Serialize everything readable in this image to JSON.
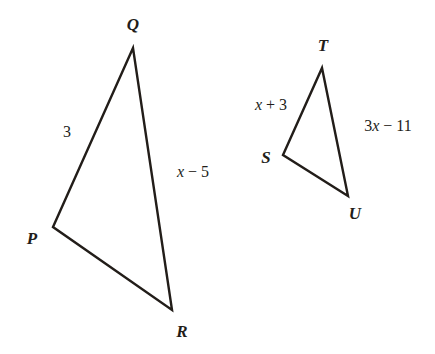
{
  "figure": {
    "background_color": "#ffffff",
    "stroke_color": "#221d19",
    "text_color": "#221d19",
    "stroke_width": 2.4,
    "width": 435,
    "height": 354
  },
  "triangles": [
    {
      "name": "PQR",
      "vertices": [
        {
          "label": "P",
          "x": 53,
          "y": 227,
          "label_x": 32,
          "label_y": 238
        },
        {
          "label": "Q",
          "x": 133,
          "y": 48,
          "label_x": 133,
          "label_y": 24
        },
        {
          "label": "R",
          "x": 172,
          "y": 310,
          "label_x": 182,
          "label_y": 331
        }
      ],
      "path": "M 53 227 L 133 48 L 172 310 Z",
      "sides": [
        {
          "name": "PQ",
          "label_full": "3",
          "prefix": "3",
          "variable": "",
          "operator": "",
          "constant": "",
          "label_x": 67,
          "label_y": 132
        },
        {
          "name": "QR",
          "label_full": "x − 5",
          "prefix": "",
          "variable": "x",
          "operator": " − ",
          "constant": "5",
          "label_x": 193,
          "label_y": 172
        }
      ]
    },
    {
      "name": "STU",
      "vertices": [
        {
          "label": "S",
          "x": 283,
          "y": 155,
          "label_x": 266,
          "label_y": 157
        },
        {
          "label": "T",
          "x": 322,
          "y": 68,
          "label_x": 323,
          "label_y": 45
        },
        {
          "label": "U",
          "x": 348,
          "y": 196,
          "label_x": 355,
          "label_y": 213
        }
      ],
      "path": "M 283 155 L 322 68 L 348 196 Z",
      "sides": [
        {
          "name": "ST",
          "label_full": "x + 3",
          "prefix": "",
          "variable": "x",
          "operator": " + ",
          "constant": "3",
          "label_x": 271,
          "label_y": 105
        },
        {
          "name": "TU",
          "label_full": "3x − 11",
          "prefix": "3",
          "variable": "x",
          "operator": " − ",
          "constant": "11",
          "label_x": 388,
          "label_y": 126
        }
      ]
    }
  ]
}
